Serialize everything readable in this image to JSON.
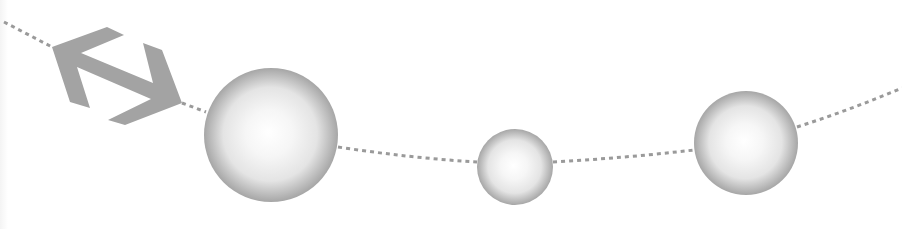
{
  "diagram": {
    "background": "#ffffff",
    "colors": {
      "arrow": "#a3a3a3",
      "dotted_line": "#9a9a9a",
      "sphere_highlight": "#ffffff",
      "sphere_mid": "#e4e4e4",
      "sphere_edge": "#a6a6a6"
    },
    "path": {
      "style": "dotted",
      "points": [
        [
          4,
          22
        ],
        [
          52,
          47
        ],
        [
          182,
          103
        ],
        [
          338,
          147
        ],
        [
          477,
          162
        ],
        [
          553,
          162
        ],
        [
          693,
          150
        ],
        [
          797,
          127
        ],
        [
          902,
          88
        ]
      ]
    },
    "arrow": {
      "icon": "double-headed-arrow-icon",
      "description": "double-headed diagonal arrow",
      "from": [
        52,
        47
      ],
      "to": [
        182,
        103
      ]
    },
    "spheres": [
      {
        "id": "sphere-large",
        "cx": 271,
        "cy": 135,
        "r": 67
      },
      {
        "id": "sphere-small",
        "cx": 515,
        "cy": 167,
        "r": 38
      },
      {
        "id": "sphere-medium",
        "cx": 746,
        "cy": 143,
        "r": 52
      }
    ]
  }
}
